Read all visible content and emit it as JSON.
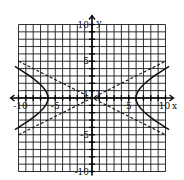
{
  "chart_data": {
    "type": "line",
    "title": "",
    "xlabel": "x",
    "ylabel": "y",
    "xlim": [
      -10,
      10
    ],
    "ylim": [
      -10,
      10
    ],
    "grid": true,
    "x_tick_labels": [
      "-10",
      "-5",
      "1",
      "5",
      "10"
    ],
    "y_tick_labels": [
      "10",
      "5",
      "1",
      "-5",
      "-10"
    ],
    "series": [
      {
        "name": "hyperbola",
        "style": "solid",
        "equation": "x^2/36 - y^2/9 = 1",
        "vertices": [
          [
            -6,
            0
          ],
          [
            6,
            0
          ]
        ]
      },
      {
        "name": "asymptote-1",
        "style": "dashed",
        "equation": "y = x/2",
        "points": [
          [
            -10,
            -5
          ],
          [
            10,
            5
          ]
        ]
      },
      {
        "name": "asymptote-2",
        "style": "dashed",
        "equation": "y = -x/2",
        "points": [
          [
            -10,
            5
          ],
          [
            10,
            -5
          ]
        ]
      }
    ]
  },
  "colors": {
    "grid": "#1a1a1a",
    "curve": "#111111",
    "background": "#ffffff"
  }
}
